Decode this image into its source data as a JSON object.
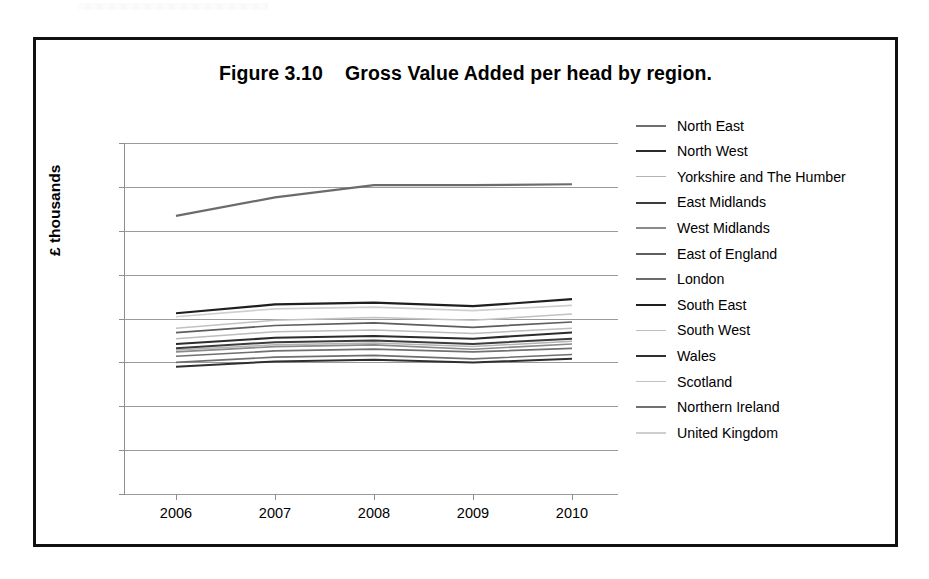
{
  "figure": {
    "frame_present": true,
    "title": "Figure 3.10    Gross Value Added per head by region."
  },
  "axes": {
    "y_title": "£ thousands",
    "y_ticks": [
      "40",
      "35",
      "30",
      "25",
      "20",
      "15",
      "10",
      "5",
      "0"
    ],
    "x_ticks": [
      "2006",
      "2007",
      "2008",
      "2009",
      "2010"
    ]
  },
  "chart_data": {
    "type": "line",
    "title": "Figure 3.10    Gross Value Added per head by region.",
    "xlabel": "",
    "ylabel": "£ thousands",
    "x": [
      "2006",
      "2007",
      "2008",
      "2009",
      "2010"
    ],
    "ylim": [
      0,
      40
    ],
    "ytick_step": 5,
    "grid": true,
    "legend_position": "right",
    "units": "GBP thousands per head",
    "series": [
      {
        "name": "North East",
        "color": "#6f6f6f",
        "width": 1.6,
        "values": [
          15.0,
          15.6,
          15.8,
          15.4,
          15.9
        ]
      },
      {
        "name": "North West",
        "color": "#2b2b2b",
        "width": 2.1,
        "values": [
          17.1,
          17.8,
          18.0,
          17.7,
          18.4
        ]
      },
      {
        "name": "Yorkshire and The Humber",
        "color": "#b4b4b4",
        "width": 1.5,
        "values": [
          16.4,
          17.0,
          17.2,
          16.8,
          17.4
        ]
      },
      {
        "name": "East Midlands",
        "color": "#3c3c3c",
        "width": 2.0,
        "values": [
          16.6,
          17.3,
          17.5,
          17.1,
          17.7
        ]
      },
      {
        "name": "West Midlands",
        "color": "#8a8a8a",
        "width": 1.6,
        "values": [
          16.2,
          16.8,
          17.0,
          16.5,
          17.1
        ]
      },
      {
        "name": "East of England",
        "color": "#5e5e5e",
        "width": 1.7,
        "values": [
          18.4,
          19.2,
          19.5,
          19.0,
          19.6
        ]
      },
      {
        "name": "London",
        "color": "#6b6b6b",
        "width": 2.2,
        "values": [
          31.7,
          33.8,
          35.2,
          35.2,
          35.3
        ]
      },
      {
        "name": "South East",
        "color": "#1f1f1f",
        "width": 2.2,
        "values": [
          20.6,
          21.6,
          21.8,
          21.4,
          22.2
        ]
      },
      {
        "name": "South West",
        "color": "#bdbdbd",
        "width": 1.5,
        "values": [
          17.7,
          18.5,
          18.7,
          18.3,
          18.9
        ]
      },
      {
        "name": "Wales",
        "color": "#2f2f2f",
        "width": 2.0,
        "values": [
          14.5,
          15.1,
          15.3,
          15.0,
          15.4
        ]
      },
      {
        "name": "Scotland",
        "color": "#c2c2c2",
        "width": 1.5,
        "values": [
          18.9,
          19.8,
          20.1,
          19.8,
          20.5
        ]
      },
      {
        "name": "Northern Ireland",
        "color": "#707070",
        "width": 1.7,
        "values": [
          15.7,
          16.3,
          16.5,
          16.2,
          16.6
        ]
      },
      {
        "name": "United Kingdom",
        "color": "#cfcfcf",
        "width": 1.6,
        "values": [
          20.2,
          21.1,
          21.3,
          20.9,
          21.5
        ]
      }
    ]
  }
}
